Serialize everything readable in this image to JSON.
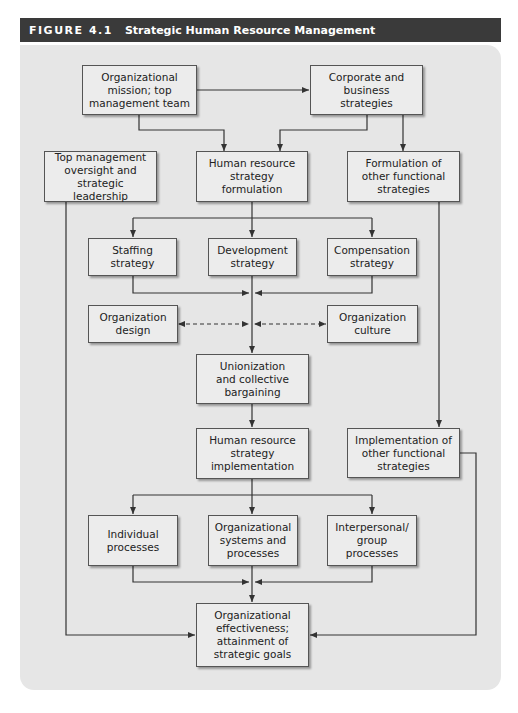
{
  "figure": {
    "number": "FIGURE 4.1",
    "title": "Strategic Human Resource Management"
  },
  "colors": {
    "header_bg": "#3a3a3a",
    "panel_bg": "#e6e6e6",
    "box_bg": "#ececec",
    "line": "#333333"
  },
  "nodes": {
    "org_mission": "Organizational\nmission; top\nmanagement team",
    "corporate": "Corporate and\nbusiness\nstrategies",
    "top_mgmt": "Top management\noversight and\nstrategic leadership",
    "hr_formulation": "Human resource\nstrategy\nformulation",
    "other_formulation": "Formulation of\nother functional\nstrategies",
    "staffing": "Staffing\nstrategy",
    "development": "Development\nstrategy",
    "compensation": "Compensation\nstrategy",
    "org_design": "Organization\ndesign",
    "org_culture": "Organization\nculture",
    "unionization": "Unionization\nand collective\nbargaining",
    "hr_implementation": "Human resource\nstrategy\nimplementation",
    "other_implementation": "Implementation of\nother functional\nstrategies",
    "individual": "Individual\nprocesses",
    "org_systems": "Organizational\nsystems and\nprocesses",
    "interpersonal": "Interpersonal/\ngroup\nprocesses",
    "effectiveness": "Organizational\neffectiveness;\nattainment of\nstrategic goals"
  },
  "edges": [
    {
      "from": "org_mission",
      "to": "corporate",
      "style": "solid"
    },
    {
      "from": "org_mission",
      "to": "hr_formulation",
      "style": "solid"
    },
    {
      "from": "corporate",
      "to": "hr_formulation",
      "style": "solid"
    },
    {
      "from": "corporate",
      "to": "other_formulation",
      "style": "solid"
    },
    {
      "from": "hr_formulation",
      "to": "staffing",
      "style": "solid"
    },
    {
      "from": "hr_formulation",
      "to": "development",
      "style": "solid"
    },
    {
      "from": "hr_formulation",
      "to": "compensation",
      "style": "solid"
    },
    {
      "from": "staffing",
      "to": "unionization",
      "style": "solid"
    },
    {
      "from": "development",
      "to": "unionization",
      "style": "solid"
    },
    {
      "from": "compensation",
      "to": "unionization",
      "style": "solid"
    },
    {
      "from": "org_design",
      "to": "development_line",
      "style": "dashed-bidirectional"
    },
    {
      "from": "org_culture",
      "to": "development_line",
      "style": "dashed-bidirectional"
    },
    {
      "from": "unionization",
      "to": "hr_implementation",
      "style": "solid"
    },
    {
      "from": "other_formulation",
      "to": "other_implementation",
      "style": "solid"
    },
    {
      "from": "hr_implementation",
      "to": "individual",
      "style": "solid"
    },
    {
      "from": "hr_implementation",
      "to": "org_systems",
      "style": "solid"
    },
    {
      "from": "hr_implementation",
      "to": "interpersonal",
      "style": "solid"
    },
    {
      "from": "individual",
      "to": "effectiveness",
      "style": "solid"
    },
    {
      "from": "org_systems",
      "to": "effectiveness",
      "style": "solid"
    },
    {
      "from": "interpersonal",
      "to": "effectiveness",
      "style": "solid"
    },
    {
      "from": "top_mgmt",
      "to": "effectiveness",
      "style": "solid"
    },
    {
      "from": "other_implementation",
      "to": "effectiveness",
      "style": "solid"
    }
  ]
}
